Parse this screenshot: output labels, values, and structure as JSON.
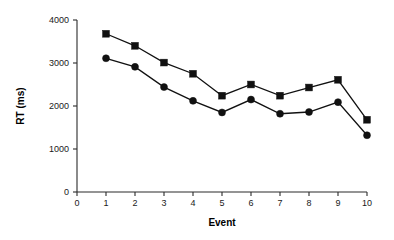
{
  "chart_data": {
    "type": "line",
    "title": "",
    "xlabel": "Event",
    "ylabel": "RT (ms)",
    "x": [
      1,
      2,
      3,
      4,
      5,
      6,
      7,
      8,
      9,
      10
    ],
    "xlim": [
      0,
      10
    ],
    "ylim": [
      0,
      4000
    ],
    "xticks": [
      "0",
      "1",
      "2",
      "3",
      "4",
      "5",
      "6",
      "7",
      "8",
      "9",
      "10"
    ],
    "xtick_values": [
      0,
      1,
      2,
      3,
      4,
      5,
      6,
      7,
      8,
      9,
      10
    ],
    "yticks": [
      "0",
      "1000",
      "2000",
      "3000",
      "4000"
    ],
    "ytick_values": [
      0,
      1000,
      2000,
      3000,
      4000
    ],
    "grid": false,
    "legend": "none",
    "series": [
      {
        "name": "upper-series",
        "marker": "square",
        "color": "#111111",
        "values": [
          3680,
          3400,
          3010,
          2750,
          2240,
          2500,
          2240,
          2430,
          2610,
          1680
        ]
      },
      {
        "name": "lower-series",
        "marker": "circle",
        "color": "#111111",
        "values": [
          3110,
          2910,
          2440,
          2120,
          1850,
          2150,
          1820,
          1860,
          2090,
          1320
        ]
      }
    ]
  },
  "axes": {
    "x_axis_name": "event-axis",
    "y_axis_name": "rt-axis"
  }
}
